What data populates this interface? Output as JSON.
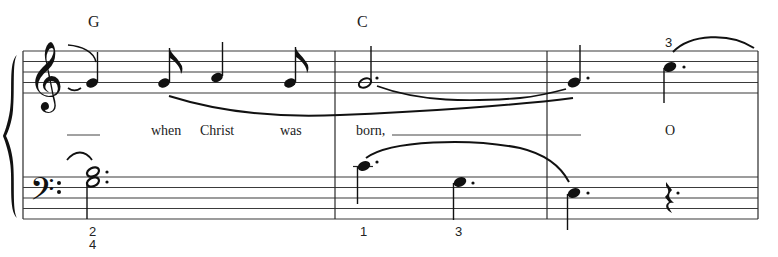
{
  "score": {
    "systems": 1,
    "staves": [
      "treble",
      "bass"
    ],
    "time_signature_visible": false,
    "chord_symbols": [
      {
        "label": "G",
        "measure": 1
      },
      {
        "label": "C",
        "measure": 2
      }
    ],
    "lyrics": [
      {
        "text": "",
        "measure": 1,
        "extender": true
      },
      {
        "text": "when",
        "measure": 1
      },
      {
        "text": "Christ",
        "measure": 1
      },
      {
        "text": "was",
        "measure": 1
      },
      {
        "text": "born,",
        "measure": 2,
        "extender": true
      },
      {
        "text": "O",
        "measure": 3
      }
    ],
    "fingerings": [
      {
        "label": "3",
        "staff": "treble",
        "measure": 3
      },
      {
        "label": "2",
        "staff": "bass",
        "measure": 1
      },
      {
        "label": "4",
        "staff": "bass",
        "measure": 1
      },
      {
        "label": "1",
        "staff": "bass",
        "measure": 2
      },
      {
        "label": "3",
        "staff": "bass",
        "measure": 2
      }
    ],
    "treble_notes": [
      {
        "pitch": "G4",
        "duration": "quarter",
        "measure": 1,
        "tied_from_previous": true
      },
      {
        "pitch": "G4",
        "duration": "eighth",
        "measure": 1
      },
      {
        "pitch": "A4",
        "duration": "quarter",
        "measure": 1
      },
      {
        "pitch": "G4",
        "duration": "eighth",
        "measure": 1
      },
      {
        "pitch": "G4",
        "duration": "dotted-half",
        "measure": 2
      },
      {
        "pitch": "G4",
        "duration": "dotted-quarter",
        "measure": 3
      },
      {
        "pitch": "C5",
        "duration": "dotted-quarter",
        "measure": 3
      }
    ],
    "bass_notes": [
      {
        "pitch": "G3+B3",
        "duration": "dotted-half",
        "measure": 1,
        "tied_from_previous": true
      },
      {
        "pitch": "C4",
        "duration": "dotted-quarter",
        "measure": 2
      },
      {
        "pitch": "G3",
        "duration": "dotted-quarter",
        "measure": 2
      },
      {
        "pitch": "E3",
        "duration": "dotted-quarter",
        "measure": 3
      },
      {
        "pitch": "rest",
        "duration": "dotted-quarter",
        "measure": 3
      }
    ],
    "icons": {
      "brace": "grand-staff-brace",
      "treble_clef": "treble-clef-icon",
      "bass_clef": "bass-clef-icon",
      "quarter_rest": "quarter-rest-icon"
    }
  }
}
